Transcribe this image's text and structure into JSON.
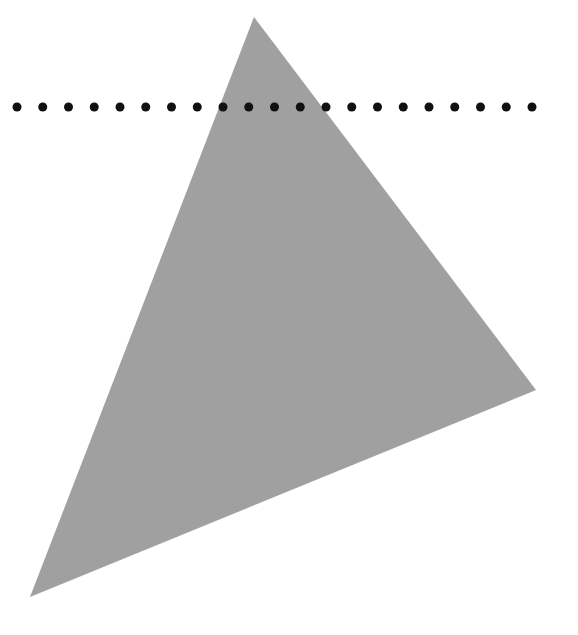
{
  "canvas": {
    "width": 578,
    "height": 635,
    "background": "#ffffff"
  },
  "triangle": {
    "points": [
      [
        254,
        17
      ],
      [
        536,
        390
      ],
      [
        30,
        597
      ]
    ],
    "fill": "#a0a0a0"
  },
  "dotted_line": {
    "y": 107,
    "x_start": 17,
    "spacing": 25.75,
    "count": 21,
    "radius": 4.5,
    "color": "#111111"
  }
}
